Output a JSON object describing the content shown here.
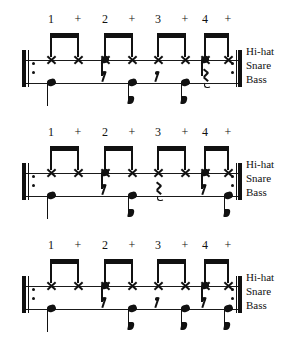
{
  "page": {
    "background_color": "#ffffff",
    "ink_color": "#111111"
  },
  "instrument_labels": [
    "Hi-hat",
    "Snare",
    "Bass"
  ],
  "counts": [
    "1",
    "+",
    "2",
    "+",
    "3",
    "+",
    "4",
    "+"
  ],
  "count_x": [
    51,
    78,
    105,
    132,
    158,
    185,
    205,
    228
  ],
  "note_x": [
    51,
    78,
    105,
    132,
    158,
    185,
    205,
    228
  ],
  "systems": [
    {
      "name": "groove-1",
      "repeat_start": true,
      "repeat_end": true,
      "hihat": [
        "x",
        "x",
        "x",
        "x",
        "x",
        "x",
        "x",
        "x"
      ],
      "snare": [
        "",
        "",
        "snare",
        "",
        "",
        "",
        "snare",
        ""
      ],
      "bass": [
        "quarter",
        "",
        "eighth-rest",
        "eighth",
        "eighth-rest",
        "eighth",
        "quarter-rest",
        ""
      ],
      "beams": [
        {
          "from": 0,
          "to": 1
        },
        {
          "from": 2,
          "to": 3
        },
        {
          "from": 4,
          "to": 5
        },
        {
          "from": 6,
          "to": 7
        }
      ]
    },
    {
      "name": "groove-2",
      "repeat_start": true,
      "repeat_end": true,
      "hihat": [
        "x",
        "x",
        "x",
        "x",
        "x",
        "x",
        "x",
        "x"
      ],
      "snare": [
        "",
        "",
        "snare",
        "",
        "",
        "",
        "snare",
        ""
      ],
      "bass": [
        "quarter",
        "",
        "eighth-rest",
        "eighth",
        "quarter-rest",
        "",
        "eighth-rest",
        "eighth"
      ],
      "beams": [
        {
          "from": 0,
          "to": 1
        },
        {
          "from": 2,
          "to": 3
        },
        {
          "from": 4,
          "to": 5
        },
        {
          "from": 6,
          "to": 7
        }
      ]
    },
    {
      "name": "groove-3",
      "repeat_start": true,
      "repeat_end": true,
      "hihat": [
        "x",
        "x",
        "x",
        "x",
        "x",
        "x",
        "x",
        "x"
      ],
      "snare": [
        "",
        "",
        "snare",
        "",
        "",
        "",
        "snare",
        ""
      ],
      "bass": [
        "quarter",
        "",
        "eighth-rest",
        "eighth",
        "eighth-rest",
        "eighth",
        "eighth-rest",
        "eighth"
      ],
      "beams": [
        {
          "from": 0,
          "to": 1
        },
        {
          "from": 2,
          "to": 3
        },
        {
          "from": 4,
          "to": 5
        },
        {
          "from": 6,
          "to": 7
        }
      ]
    }
  ]
}
